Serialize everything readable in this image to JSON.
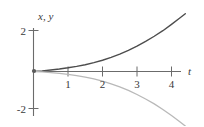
{
  "figure": {
    "background_color": "#ffffff",
    "axis_color": "#6b6b6b",
    "text_color": "#3a3a3a"
  },
  "chart_data": {
    "type": "line",
    "title": "",
    "subtitle": "",
    "xlabel": "t",
    "ylabel": "x, y",
    "xlim": [
      -0.25,
      4.55
    ],
    "ylim": [
      -2.6,
      2.5
    ],
    "grid": false,
    "legend": false,
    "legend_position": "none",
    "x_ticks": [
      1,
      2,
      3,
      4
    ],
    "x_tick_labels": [
      "1",
      "2",
      "3",
      "4"
    ],
    "y_ticks": [
      2,
      -2
    ],
    "y_tick_labels": [
      "2",
      "-2"
    ],
    "annotations": [],
    "series": [
      {
        "name": "x",
        "color": "#4d4d4d",
        "width": 1.4,
        "description": "increasing exponential growth curve from origin",
        "x": [
          0,
          0.25,
          0.5,
          0.75,
          1,
          1.25,
          1.5,
          1.75,
          2,
          2.25,
          2.5,
          2.75,
          3,
          3.25,
          3.5,
          3.75,
          4,
          4.25,
          4.4
        ],
        "values": [
          0.0,
          0.03,
          0.07,
          0.12,
          0.18,
          0.25,
          0.33,
          0.43,
          0.55,
          0.69,
          0.85,
          1.03,
          1.24,
          1.47,
          1.72,
          1.99,
          2.3,
          2.62,
          2.82
        ]
      },
      {
        "name": "y",
        "color": "#b9b9b9",
        "width": 1.2,
        "description": "decreasing exponential decay curve from origin",
        "x": [
          0,
          0.25,
          0.5,
          0.75,
          1,
          1.25,
          1.5,
          1.75,
          2,
          2.25,
          2.5,
          2.75,
          3,
          3.25,
          3.5,
          3.75,
          4,
          4.25,
          4.4
        ],
        "values": [
          0.0,
          -0.02,
          -0.05,
          -0.09,
          -0.14,
          -0.2,
          -0.27,
          -0.36,
          -0.47,
          -0.6,
          -0.75,
          -0.92,
          -1.12,
          -1.34,
          -1.58,
          -1.85,
          -2.15,
          -2.46,
          -2.66
        ]
      }
    ]
  }
}
